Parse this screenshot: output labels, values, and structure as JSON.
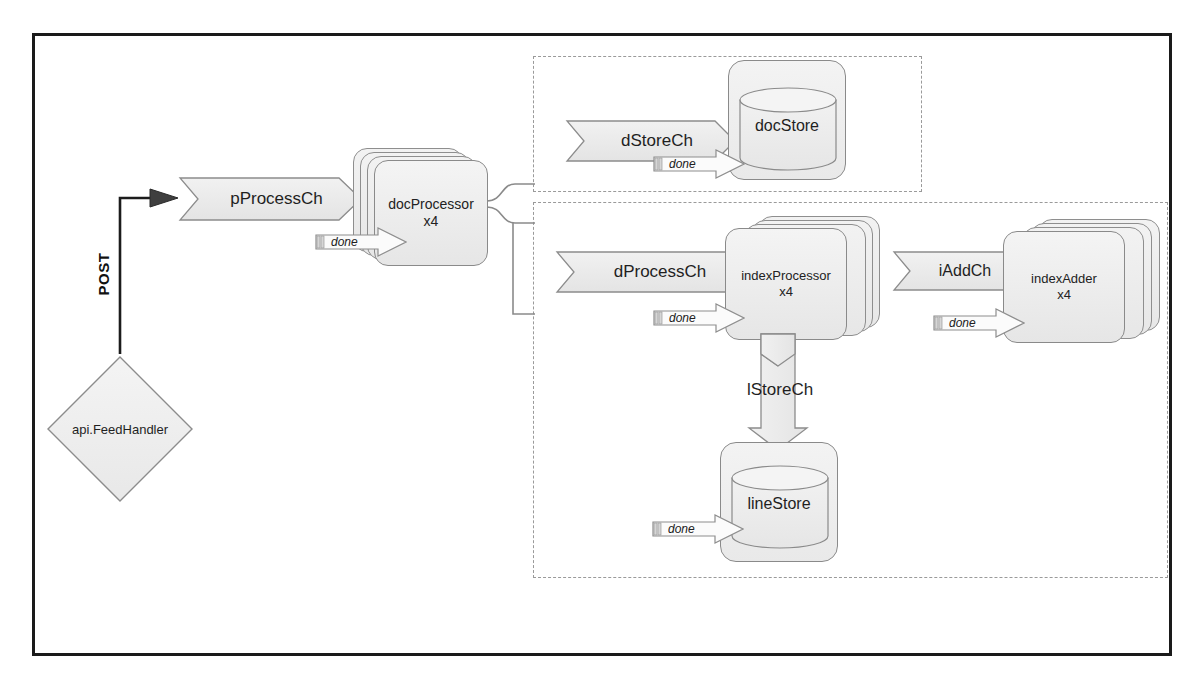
{
  "diagram": {
    "frame_border_color": "#1a1a1a",
    "fill_color": "#eeeeee",
    "stroke_color": "#8a8a8a",
    "dashed_group_color": "#9a9a9a"
  },
  "entry": {
    "handler_label": "api.FeedHandler",
    "post_label": "POST"
  },
  "channels": {
    "pProcessCh": "pProcessCh",
    "dStoreCh": "dStoreCh",
    "dProcessCh": "dProcessCh",
    "iAddCh": "iAddCh",
    "lStoreCh": "lStoreCh"
  },
  "workers": {
    "docProcessor": {
      "name": "docProcessor",
      "count": "x4"
    },
    "indexProcessor": {
      "name": "indexProcessor",
      "count": "x4"
    },
    "indexAdder": {
      "name": "indexAdder",
      "count": "x4"
    }
  },
  "stores": {
    "docStore": "docStore",
    "lineStore": "lineStore"
  },
  "done_labels": {
    "docProcessor_done": "done",
    "docStore_done": "done",
    "indexProcessor_done": "done",
    "indexAdder_done": "done",
    "lineStore_done": "done"
  }
}
